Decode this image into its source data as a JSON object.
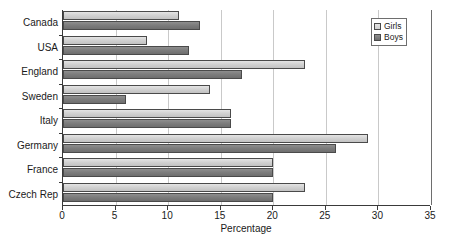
{
  "chart_data": {
    "type": "bar",
    "orientation": "horizontal",
    "title": "",
    "xlabel": "Percentage",
    "ylabel": "",
    "xlim": [
      0,
      35
    ],
    "xticks": [
      0,
      5,
      10,
      15,
      20,
      25,
      30,
      35
    ],
    "xtick_labels": [
      "0",
      "5",
      "10",
      "15",
      "20",
      "25",
      "30",
      "35"
    ],
    "grid": "vertical",
    "legend_position": "top-right",
    "categories": [
      "Canada",
      "USA",
      "England",
      "Sweden",
      "Italy",
      "Germany",
      "France",
      "Czech Rep"
    ],
    "series": [
      {
        "name": "Girls",
        "color": "#d2d2d2",
        "values": [
          11,
          8,
          23,
          14,
          16,
          29,
          20,
          23
        ]
      },
      {
        "name": "Boys",
        "color": "#7d7d7d",
        "values": [
          13,
          12,
          17,
          6,
          16,
          26,
          20,
          20
        ]
      }
    ]
  },
  "legend": {
    "items": [
      {
        "label": "Girls",
        "swatch": "girls-swatch-icon"
      },
      {
        "label": "Boys",
        "swatch": "boys-swatch-icon"
      }
    ]
  },
  "axes": {
    "x_title": "Percentage"
  },
  "colors": {
    "girls": "#d2d2d2",
    "boys": "#7d7d7d",
    "axis": "#3a3a3a",
    "grid": "#c9c9c9",
    "background": "#ffffff"
  }
}
